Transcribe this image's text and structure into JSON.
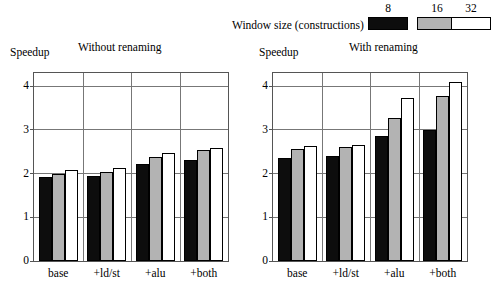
{
  "legend": {
    "title": "Window size (constructions)",
    "entries": [
      {
        "key": "8",
        "color": "#0d0d0d"
      },
      {
        "key": "16",
        "color": "#b3b3b3"
      },
      {
        "key": "32",
        "color": "#ffffff"
      }
    ]
  },
  "chart_data": [
    {
      "type": "bar",
      "title": "Without renaming",
      "xlabel": "",
      "ylabel": "Speedup",
      "ylim": [
        0,
        4.3
      ],
      "yticks": [
        0,
        1,
        2,
        3,
        4
      ],
      "ytick_labels": [
        "0",
        "1",
        "2",
        "3",
        "4"
      ],
      "grid": true,
      "legend_position": "top",
      "categories": [
        "base",
        "+ld/st",
        "+alu",
        "+both"
      ],
      "series": [
        {
          "name": "8",
          "values": [
            1.92,
            1.95,
            2.21,
            2.31
          ]
        },
        {
          "name": "16",
          "values": [
            1.99,
            2.04,
            2.39,
            2.54
          ]
        },
        {
          "name": "32",
          "values": [
            2.08,
            2.12,
            2.46,
            2.59
          ]
        }
      ]
    },
    {
      "type": "bar",
      "title": "With renaming",
      "xlabel": "",
      "ylabel": "Speedup",
      "ylim": [
        0,
        4.3
      ],
      "yticks": [
        0,
        1,
        2,
        3,
        4
      ],
      "ytick_labels": [
        "0",
        "1",
        "2",
        "3",
        "4"
      ],
      "grid": true,
      "legend_position": "top",
      "categories": [
        "base",
        "+ld/st",
        "+alu",
        "+both"
      ],
      "series": [
        {
          "name": "8",
          "values": [
            2.35,
            2.41,
            2.86,
            3.0
          ]
        },
        {
          "name": "16",
          "values": [
            2.57,
            2.6,
            3.27,
            3.77
          ]
        },
        {
          "name": "32",
          "values": [
            2.63,
            2.66,
            3.73,
            4.1
          ]
        }
      ]
    }
  ]
}
